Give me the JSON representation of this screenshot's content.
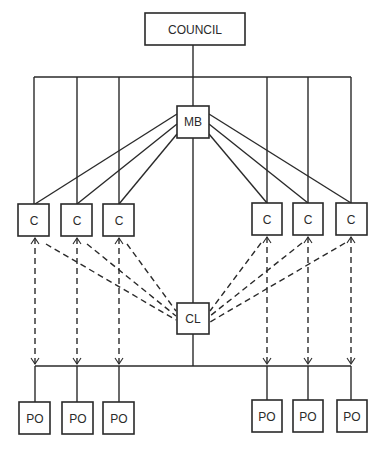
{
  "diagram": {
    "type": "organizational-structure",
    "nodes": {
      "council": {
        "label": "COUNCIL",
        "x": 145,
        "y": 13,
        "w": 100,
        "h": 32
      },
      "mb": {
        "label": "MB",
        "x": 177,
        "y": 106,
        "w": 32,
        "h": 32
      },
      "cl": {
        "label": "CL",
        "x": 177,
        "y": 303,
        "w": 32,
        "h": 31
      },
      "committees": [
        {
          "label": "C",
          "x": 18,
          "y": 204,
          "w": 31,
          "h": 32
        },
        {
          "label": "C",
          "x": 61,
          "y": 204,
          "w": 31,
          "h": 32
        },
        {
          "label": "C",
          "x": 103,
          "y": 204,
          "w": 31,
          "h": 32
        },
        {
          "label": "C",
          "x": 252,
          "y": 203,
          "w": 30,
          "h": 32
        },
        {
          "label": "C",
          "x": 293,
          "y": 203,
          "w": 30,
          "h": 32
        },
        {
          "label": "C",
          "x": 336,
          "y": 203,
          "w": 31,
          "h": 32
        }
      ],
      "program_offices": [
        {
          "label": "PO",
          "x": 19,
          "y": 402,
          "w": 31,
          "h": 32
        },
        {
          "label": "PO",
          "x": 62,
          "y": 402,
          "w": 31,
          "h": 32
        },
        {
          "label": "PO",
          "x": 103,
          "y": 402,
          "w": 31,
          "h": 32
        },
        {
          "label": "PO",
          "x": 252,
          "y": 400,
          "w": 30,
          "h": 32
        },
        {
          "label": "PO",
          "x": 293,
          "y": 400,
          "w": 30,
          "h": 32
        },
        {
          "label": "PO",
          "x": 337,
          "y": 400,
          "w": 30,
          "h": 32
        }
      ]
    },
    "edges": {
      "solid": [
        "COUNCIL-bus",
        "bus-C1",
        "bus-C2",
        "bus-C3",
        "bus-C4",
        "bus-C5",
        "bus-C6",
        "bus-MB",
        "MB-C1",
        "MB-C2",
        "MB-C3",
        "MB-C4",
        "MB-C5",
        "MB-C6",
        "MB-CL",
        "CL-bottom-bus",
        "bottom-bus-PO1..PO6"
      ],
      "dashed_bidirectional": [
        "C1-bottom-bus",
        "C2-bottom-bus",
        "C3-bottom-bus",
        "C4-bottom-bus",
        "C5-bottom-bus",
        "C6-bottom-bus"
      ],
      "dashed": [
        "C1-CL",
        "C2-CL",
        "C3-CL",
        "C4-CL",
        "C5-CL",
        "C6-CL"
      ]
    }
  }
}
